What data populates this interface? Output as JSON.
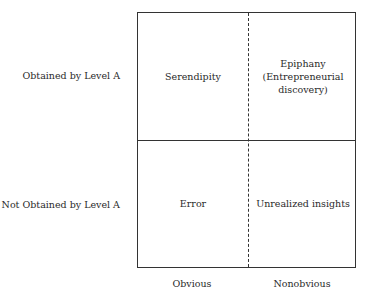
{
  "rows": [
    {
      "label": "Obtained by Level A"
    },
    {
      "label": "Not Obtained by Level A"
    }
  ],
  "columns": [
    {
      "label": "Obvious"
    },
    {
      "label": "Nonobvious"
    }
  ],
  "cells": {
    "top_left": "Serendipity",
    "top_right_line1": "Epiphany",
    "top_right_line2": "(Entrepreneurial",
    "top_right_line3": "discovery)",
    "bottom_left": "Error",
    "bottom_right": "Unrealized insights"
  }
}
